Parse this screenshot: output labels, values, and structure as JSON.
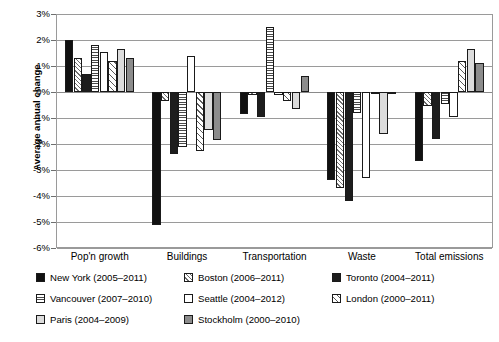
{
  "chart_data": {
    "type": "bar",
    "title": "",
    "subtitle": "",
    "xlabel": "",
    "ylabel": "Average annual change",
    "ylim": [
      -6,
      3
    ],
    "ytick_labels": [
      "3%",
      "2%",
      "1%",
      "0%",
      "-1%",
      "-2%",
      "-3%",
      "-4%",
      "-5%",
      "-6%"
    ],
    "ytick_values": [
      3,
      2,
      1,
      0,
      -1,
      -2,
      -3,
      -4,
      -5,
      -6
    ],
    "grid": true,
    "legend_position": "bottom",
    "categories": [
      "Pop'n growth",
      "Buildings",
      "Transportation",
      "Waste",
      "Total emissions"
    ],
    "series": [
      {
        "name": "New York (2005–2011)",
        "key": "newyork",
        "values": [
          2.0,
          -5.1,
          -0.85,
          -3.4,
          -2.65
        ]
      },
      {
        "name": "Boston (2006–2011)",
        "key": "boston",
        "values": [
          1.3,
          -0.35,
          -0.1,
          -3.7,
          -0.55
        ]
      },
      {
        "name": "Toronto (2004–2011)",
        "key": "toronto",
        "values": [
          0.7,
          -2.4,
          -0.95,
          -4.2,
          -1.8
        ]
      },
      {
        "name": "Vancouver (2007–2010)",
        "key": "vancouver",
        "values": [
          1.8,
          -2.1,
          2.5,
          -0.8,
          -0.45
        ]
      },
      {
        "name": "Seattle (2004–2012)",
        "key": "seattle",
        "values": [
          1.55,
          1.4,
          -0.1,
          -3.3,
          -0.95
        ]
      },
      {
        "name": "London (2000–2011)",
        "key": "london",
        "values": [
          1.2,
          -2.25,
          -0.35,
          -0.05,
          1.2
        ]
      },
      {
        "name": "Paris (2004–2009)",
        "key": "paris",
        "values": [
          1.65,
          -1.45,
          -0.65,
          -1.6,
          1.65
        ]
      },
      {
        "name": "Stockholm (2000–2010)",
        "key": "stockholm",
        "values": [
          1.3,
          -1.85,
          0.6,
          -0.05,
          1.1
        ]
      }
    ]
  },
  "axis": {
    "y_title": "Average annual change"
  },
  "legend": {
    "entries": [
      {
        "label": "New York (2005–2011)",
        "key": "newyork",
        "col": 0,
        "row": 0
      },
      {
        "label": "Boston (2006–2011)",
        "key": "boston",
        "col": 1,
        "row": 0
      },
      {
        "label": "Toronto (2004–2011)",
        "key": "toronto",
        "col": 2,
        "row": 0
      },
      {
        "label": "Vancouver (2007–2010)",
        "key": "vancouver",
        "col": 0,
        "row": 1
      },
      {
        "label": "Seattle (2004–2012)",
        "key": "seattle",
        "col": 1,
        "row": 1
      },
      {
        "label": "London (2000–2011)",
        "key": "london",
        "col": 2,
        "row": 1
      },
      {
        "label": "Paris (2004–2009)",
        "key": "paris",
        "col": 0,
        "row": 2
      },
      {
        "label": "Stockholm (2000–2010)",
        "key": "stockholm",
        "col": 1,
        "row": 2
      }
    ]
  },
  "colors": {
    "axis": "#9a9a9a",
    "bar_outline": "#1a1a1a",
    "newyork": "#111111",
    "toronto": "#1d1d1d",
    "paris": "#dcdcdc",
    "stockholm": "#8c8c8c",
    "background": "#ffffff"
  }
}
